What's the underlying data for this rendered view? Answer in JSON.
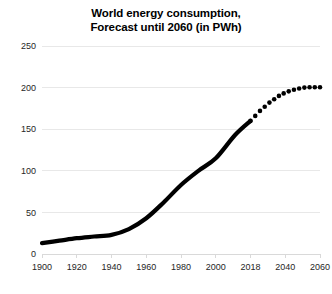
{
  "chart_data": {
    "type": "line",
    "title": "World energy consumption, Forecast until 2060 (in PWh)",
    "title_line1": "World energy consumption,",
    "title_line2": "Forecast until 2060 (in PWh)",
    "xlabel": "",
    "ylabel": "",
    "unit": "PWh",
    "xlim": [
      1900,
      2060
    ],
    "ylim": [
      0,
      250
    ],
    "yticks": [
      0,
      50,
      100,
      150,
      200,
      250
    ],
    "ytick_labels": [
      "0",
      "50",
      "100",
      "150",
      "200",
      "250"
    ],
    "xticks": [
      1900,
      1920,
      1940,
      1960,
      1980,
      2000,
      2018,
      2040,
      2060
    ],
    "xtick_labels": [
      "1900",
      "1920",
      "1940",
      "1960",
      "1980",
      "2000",
      "2018",
      "2040",
      "2060"
    ],
    "grid": true,
    "grid_axis": "y",
    "legend": false,
    "legend_position": "none",
    "line_color": "#000000",
    "grid_color": "#e8e8e8",
    "series": [
      {
        "name": "Historical consumption",
        "style": "solid",
        "x": [
          1900,
          1910,
          1920,
          1930,
          1940,
          1950,
          1960,
          1970,
          1980,
          1990,
          2000,
          2010,
          2018
        ],
        "values": [
          13,
          16,
          19,
          21,
          23,
          30,
          43,
          62,
          83,
          100,
          115,
          143,
          160
        ]
      },
      {
        "name": "Forecast consumption",
        "style": "dotted",
        "x": [
          2018,
          2021,
          2024,
          2027,
          2030,
          2033,
          2036,
          2039,
          2042,
          2045,
          2048,
          2051,
          2054,
          2057,
          2060
        ],
        "values": [
          160,
          166,
          172,
          177,
          182,
          186,
          190,
          193,
          195.5,
          197.5,
          199,
          200,
          200.5,
          200.5,
          200.5
        ]
      }
    ]
  }
}
